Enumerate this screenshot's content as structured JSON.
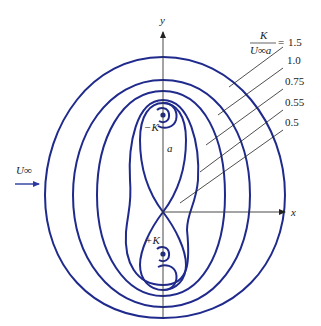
{
  "figure": {
    "colors": {
      "contour": "#1f2a8c",
      "axis": "#333333",
      "text": "#1a1a1a",
      "stream_arrow": "#2b3a9e"
    }
  },
  "axes": {
    "x_label": "x",
    "y_label": "y"
  },
  "freestream": {
    "label": "U∞"
  },
  "vortices": {
    "upper": {
      "label": "−K"
    },
    "lower": {
      "label": "+K"
    }
  },
  "dimension": {
    "label": "a"
  },
  "parameter": {
    "numerator": "K",
    "denominator": "U∞a",
    "equals": "="
  },
  "contour_levels": [
    {
      "value": "1.5"
    },
    {
      "value": "1.0"
    },
    {
      "value": "0.75"
    },
    {
      "value": "0.55"
    },
    {
      "value": "0.5"
    }
  ]
}
